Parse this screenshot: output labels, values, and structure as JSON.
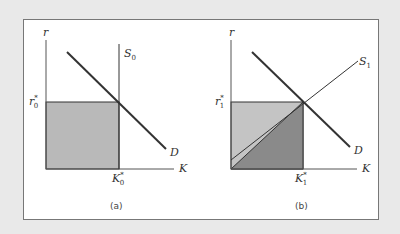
{
  "figure": {
    "panels": [
      {
        "caption": "(a)",
        "y_axis_label": "r",
        "x_axis_label": "K",
        "supply_label": "S",
        "supply_sub": "0",
        "demand_label": "D",
        "r_star": "r",
        "r_star_sub": "0",
        "k_star": "K",
        "k_star_sub": "0",
        "supply_type": "vertical"
      },
      {
        "caption": "(b)",
        "y_axis_label": "r",
        "x_axis_label": "K",
        "supply_label": "S",
        "supply_sub": "1",
        "demand_label": "D",
        "r_star": "r",
        "r_star_sub": "1",
        "k_star": "K",
        "k_star_sub": "1",
        "supply_type": "upward-sloping"
      }
    ],
    "colors": {
      "background": "#e9e9e9",
      "panel_bg": "#ffffff",
      "shade_a": "#b9b9b9",
      "shade_b_light": "#c4c4c4",
      "shade_b_dark": "#8a8a8a",
      "lines": "#333333"
    }
  }
}
